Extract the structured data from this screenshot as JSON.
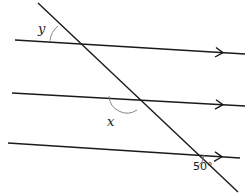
{
  "diagram": {
    "type": "parallel-lines-transversal",
    "parallel_lines": [
      {
        "id": "line-1",
        "from": [
          15,
          40
        ],
        "to": [
          245,
          54
        ],
        "arrow_at": [
          222,
          52.6
        ]
      },
      {
        "id": "line-2",
        "from": [
          12,
          93
        ],
        "to": [
          245,
          106
        ],
        "arrow_at": [
          222,
          104.7
        ]
      },
      {
        "id": "line-3",
        "from": [
          8,
          143
        ],
        "to": [
          240,
          158
        ],
        "arrow_at": [
          221,
          156.8
        ]
      }
    ],
    "transversal": {
      "from": [
        38,
        3
      ],
      "to": [
        238,
        192
      ]
    },
    "angles": {
      "y": {
        "label": "y",
        "position": "upper-left at top intersection"
      },
      "x": {
        "label": "x",
        "position": "lower-left at middle intersection"
      },
      "given": {
        "label": "50°",
        "value": 50,
        "position": "lower-right at bottom intersection"
      }
    },
    "colors": {
      "line": "#1a1a1a",
      "arc": "#777777",
      "text": "#222222"
    }
  }
}
